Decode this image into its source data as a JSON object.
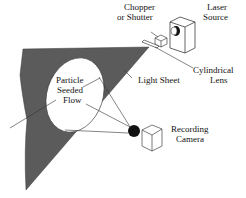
{
  "diagram": {
    "labels": {
      "chopper_line1": "Chopper",
      "chopper_line2": "or Shutter",
      "laser_line1": "Laser",
      "laser_line2": "Source",
      "lens_line1": "Cylindrical",
      "lens_line2": "Lens",
      "light_sheet": "Light Sheet",
      "flow_line1": "Particle",
      "flow_line2": "Seeded",
      "flow_line3": "Flow",
      "camera_line1": "Recording",
      "camera_line2": "Camera"
    },
    "colors": {
      "sheet": "#5a5a5a",
      "stroke": "#222222",
      "background": "#ffffff"
    }
  }
}
